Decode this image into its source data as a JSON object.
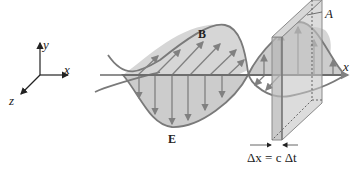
{
  "diagram": {
    "type": "electromagnetic-wave",
    "axes": {
      "y_label": "y",
      "x_label": "x",
      "z_label": "z"
    },
    "main_axis_label": "x",
    "field_labels": {
      "magnetic": "B",
      "electric": "E"
    },
    "area_label": "A",
    "slab_equation": "Δx = c Δt",
    "colors": {
      "wave_fill": "#cfcfcf",
      "wave_stroke": "#7a7a7a",
      "vector": "#808080",
      "plate_fill": "#bdbdbd",
      "text": "#222222"
    }
  }
}
